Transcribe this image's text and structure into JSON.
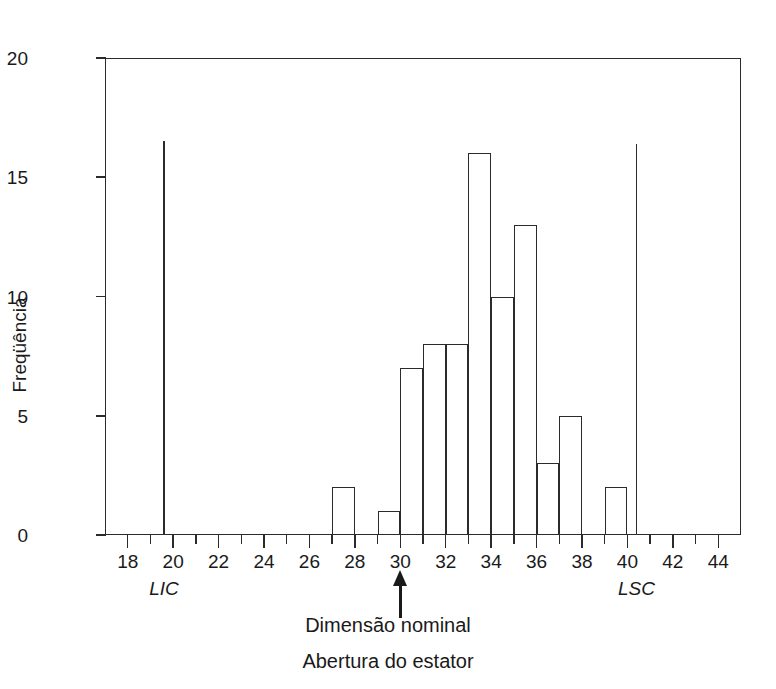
{
  "chart_data": {
    "type": "bar",
    "title": "",
    "subtitle": "",
    "xlabel": "Abertura do estator",
    "ylabel": "Freqüência",
    "xlim": [
      17,
      45
    ],
    "ylim": [
      0,
      20
    ],
    "grid": false,
    "legend": false,
    "bin_width": 1,
    "bins": [
      {
        "start": 27,
        "end": 28,
        "value": 2
      },
      {
        "start": 29,
        "end": 30,
        "value": 1
      },
      {
        "start": 30,
        "end": 31,
        "value": 7
      },
      {
        "start": 31,
        "end": 32,
        "value": 8
      },
      {
        "start": 32,
        "end": 33,
        "value": 8
      },
      {
        "start": 33,
        "end": 34,
        "value": 16
      },
      {
        "start": 34,
        "end": 35,
        "value": 10
      },
      {
        "start": 35,
        "end": 36,
        "value": 13
      },
      {
        "start": 36,
        "end": 37,
        "value": 3
      },
      {
        "start": 37,
        "end": 38,
        "value": 5
      },
      {
        "start": 39,
        "end": 40,
        "value": 2
      }
    ],
    "categories": [
      "27-28",
      "29-30",
      "30-31",
      "31-32",
      "32-33",
      "33-34",
      "34-35",
      "35-36",
      "36-37",
      "37-38",
      "39-40"
    ],
    "values": [
      2,
      1,
      7,
      8,
      8,
      16,
      10,
      13,
      3,
      5,
      2
    ],
    "x_ticks_major": [
      18,
      20,
      22,
      24,
      26,
      28,
      30,
      32,
      34,
      36,
      38,
      40,
      42,
      44
    ],
    "x_ticks_minor": [
      17,
      19,
      21,
      23,
      25,
      27,
      29,
      31,
      33,
      35,
      37,
      39,
      41,
      43,
      45
    ],
    "y_ticks": [
      0,
      5,
      10,
      15,
      20
    ],
    "annotations": [
      {
        "name": "lower-spec-limit",
        "label": "LIC",
        "x": 19.6,
        "height": 16.5
      },
      {
        "name": "upper-spec-limit",
        "label": "LSC",
        "x": 40.4,
        "height": 16.4
      },
      {
        "name": "nominal-dimension-arrow",
        "label": "Dimensão nominal",
        "x": 30
      }
    ]
  },
  "axes": {
    "y_title": "Freqüência",
    "y_tick_labels": [
      "0",
      "5",
      "10",
      "15",
      "20"
    ],
    "x_tick_labels": [
      "18",
      "20",
      "22",
      "24",
      "26",
      "28",
      "30",
      "32",
      "34",
      "36",
      "38",
      "40",
      "42",
      "44"
    ]
  },
  "labels": {
    "lic": "LIC",
    "lsc": "LSC",
    "caption_line_1": "Dimensão nominal",
    "caption_line_2": "Abertura do estator"
  },
  "colors": {
    "ink": "#2b2b2b",
    "background": "#ffffff"
  }
}
